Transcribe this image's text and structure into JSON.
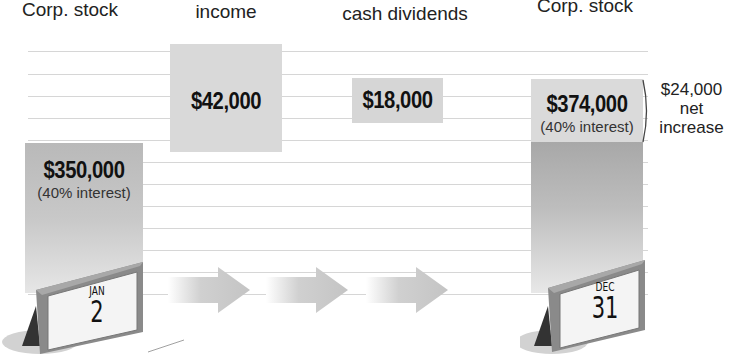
{
  "headers": {
    "col1": "Corp. stock",
    "col2": "income",
    "col3": "cash dividends",
    "col4": "Corp. stock"
  },
  "start_balance": {
    "amount": "$350,000",
    "note": "(40% interest)",
    "calendar": {
      "month": "JAN",
      "day": "2"
    }
  },
  "income_box": {
    "amount": "$42,000"
  },
  "dividends_box": {
    "amount": "$18,000"
  },
  "end_balance": {
    "amount": "$374,000",
    "note": "(40% interest)",
    "calendar": {
      "month": "DEC",
      "day": "31"
    }
  },
  "net_change": {
    "line1": "$24,000",
    "line2": "net",
    "line3": "increase"
  },
  "colors": {
    "bar_light": "#d4d4d4",
    "bar_dark": "#a9a9a9",
    "rule": "#d6d6d6",
    "arrow": "#c8c8c8"
  }
}
